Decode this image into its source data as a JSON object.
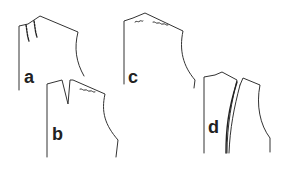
{
  "diagram": {
    "type": "sewing pattern bodice pieces",
    "colors": {
      "line": "#333333",
      "background": "#ffffff"
    },
    "pieces": [
      {
        "id": "a",
        "label": "a",
        "description": "bodice with two slanted ease-stitching lines near neck"
      },
      {
        "id": "b",
        "label": "b",
        "description": "bodice with a shoulder dart and wavy ease line"
      },
      {
        "id": "c",
        "label": "c",
        "description": "bodice with two wavy ease lines along shoulder"
      },
      {
        "id": "d",
        "label": "d",
        "description": "bodice split into two pieces with overlapping curved seam"
      }
    ]
  }
}
